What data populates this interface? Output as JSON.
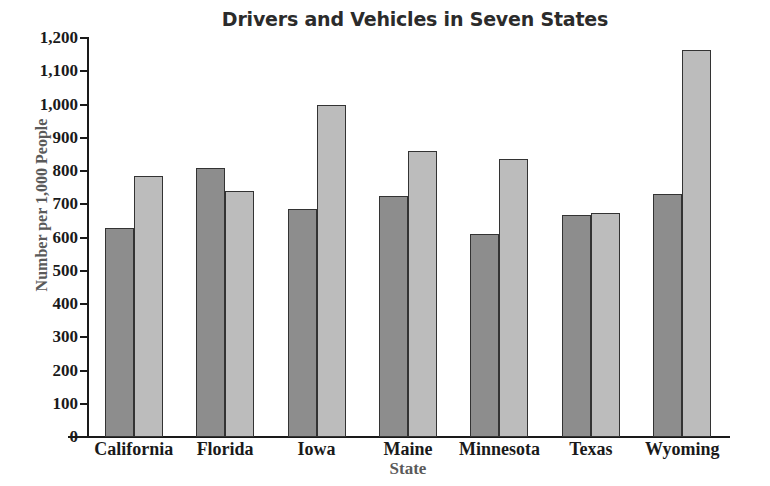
{
  "chart_data": {
    "type": "bar",
    "title": "Drivers and Vehicles in Seven States",
    "xlabel": "State",
    "ylabel": "Number per 1,000 People",
    "categories": [
      "California",
      "Florida",
      "Iowa",
      "Maine",
      "Minnesota",
      "Texas",
      "Wyoming"
    ],
    "series": [
      {
        "name": "Drivers",
        "color": "#8d8d8d",
        "values": [
          630,
          810,
          685,
          725,
          610,
          668,
          730
        ]
      },
      {
        "name": "Vehicles",
        "color": "#bcbcbc",
        "values": [
          785,
          740,
          1000,
          860,
          835,
          673,
          1165
        ]
      }
    ],
    "ylim": [
      0,
      1200
    ],
    "ytick_step": 100,
    "ytick_labels": [
      "0",
      "100",
      "200",
      "300",
      "400",
      "500",
      "600",
      "700",
      "800",
      "900",
      "1,000",
      "1,100",
      "1,200"
    ],
    "grid": false,
    "legend": "none"
  },
  "source_note": "Source: World Almanac and Book of Facts 2000, Copyright © 1999 Primedia"
}
